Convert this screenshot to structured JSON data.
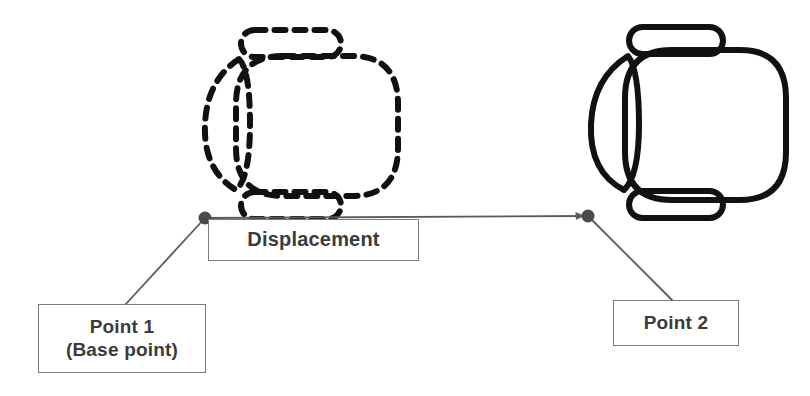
{
  "diagram": {
    "background_color": "#ffffff",
    "stroke_color": "#111111",
    "leader_color": "#5a5a5a",
    "box_border_color": "#7a7a7a",
    "text_color": "#3b3b3b"
  },
  "labels": {
    "displacement": "Displacement",
    "point1_line1": "Point 1",
    "point1_line2": "(Base point)",
    "point2": "Point 2"
  },
  "shapes": {
    "original": {
      "name": "chair-outline-original",
      "style": "dashed",
      "description": "Top view of an office chair drawn with a dashed outline, showing the original position"
    },
    "moved": {
      "name": "chair-outline-moved",
      "style": "solid",
      "description": "Top view of an office chair drawn with a solid outline, showing the displaced position"
    }
  },
  "points": {
    "base_point": {
      "label": "Point 1",
      "x": 205,
      "y": 218
    },
    "target_point": {
      "label": "Point 2",
      "x": 588,
      "y": 216
    }
  },
  "vector": {
    "name": "displacement-vector",
    "from_x": 205,
    "from_y": 218,
    "to_x": 588,
    "to_y": 216,
    "arrowhead": "filled-triangle-at-end"
  }
}
